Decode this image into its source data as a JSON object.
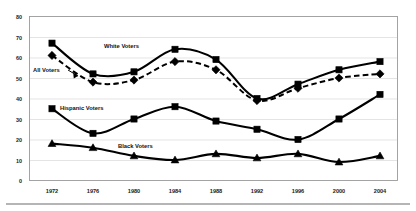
{
  "chart_data": {
    "type": "line",
    "title": "",
    "subtitle": "",
    "xlabel": "",
    "ylabel": "",
    "categories": [
      "1972",
      "1976",
      "1980",
      "1984",
      "1988",
      "1992",
      "1996",
      "2000",
      "2004"
    ],
    "ylim": [
      0,
      80
    ],
    "ytick_labels": [
      "0",
      "10",
      "20",
      "30",
      "40",
      "50",
      "60",
      "70",
      "80"
    ],
    "ytick_values": [
      0,
      10,
      20,
      30,
      40,
      50,
      60,
      70,
      80
    ],
    "grid": true,
    "grid_axis": "y",
    "legend": "inline-annotations",
    "legend_position": "inside-plot",
    "series": [
      {
        "name": "White Voters",
        "marker": "square",
        "line_style": "solid",
        "color": "#000000",
        "values": [
          67,
          52,
          53,
          64,
          59,
          40,
          47,
          54,
          58
        ]
      },
      {
        "name": "All Voters",
        "marker": "diamond",
        "line_style": "dashed",
        "color": "#000000",
        "values": [
          61,
          48,
          49,
          58,
          54,
          39,
          45,
          50,
          52
        ]
      },
      {
        "name": "Hispanic Voters",
        "marker": "square",
        "line_style": "solid",
        "color": "#000000",
        "values": [
          35,
          23,
          30,
          36,
          29,
          25,
          20,
          30,
          42
        ]
      },
      {
        "name": "Black Voters",
        "marker": "triangle",
        "line_style": "solid",
        "color": "#000000",
        "values": [
          18,
          16,
          12,
          10,
          13,
          11,
          13,
          9,
          12
        ]
      }
    ],
    "annotations": [
      {
        "label": "White Voters",
        "series": "White Voters"
      },
      {
        "label": "All Voters",
        "series": "All Voters"
      },
      {
        "label": "Hispanic Voters",
        "series": "Hispanic Voters"
      },
      {
        "label": "Black Voters",
        "series": "Black Voters"
      }
    ]
  },
  "axes": {
    "y_ticks": [
      "80",
      "70",
      "60",
      "50",
      "40",
      "30",
      "20",
      "10",
      "0"
    ],
    "x_ticks": [
      "1972",
      "1976",
      "1980",
      "1984",
      "1988",
      "1992",
      "1996",
      "2000",
      "2004"
    ]
  },
  "labels": {
    "white_voters": "White Voters",
    "all_voters": "All Voters",
    "hispanic_voters": "Hispanic Voters",
    "black_voters": "Black Voters"
  },
  "colors": {
    "ink": "#000000",
    "grid": "#d9d9d9",
    "frame": "#9a9a9a",
    "background": "#ffffff"
  }
}
